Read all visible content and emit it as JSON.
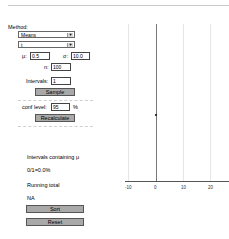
{
  "controls": {
    "method_label": "Method:",
    "method_select": "Means",
    "dist_select": "t",
    "mu_label": "μ:",
    "mu_value": "0.5",
    "sigma_label": "σ:",
    "sigma_value": "10.0",
    "n_label": "n:",
    "n_value": "100",
    "intervals_label": "Intervals:",
    "intervals_value": "1",
    "sample_button": "Sample",
    "conf_label": "conf level:",
    "conf_value": "95",
    "conf_unit": "%",
    "recalc_button": "Recalculate",
    "containing_label": "Intervals containing μ",
    "containing_value": "0/1=0.0%",
    "running_label": "Running total",
    "running_value": "NA",
    "sort_button": "Sort",
    "reset_button": "Reset"
  },
  "chart": {
    "ticks": [
      "-10",
      "0",
      "10",
      "20"
    ]
  }
}
